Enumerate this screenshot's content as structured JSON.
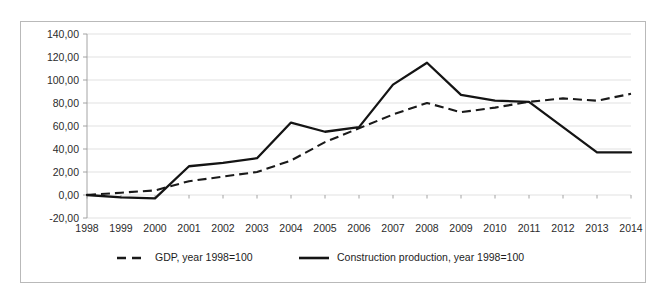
{
  "chart_data": {
    "type": "line",
    "title": "",
    "subtitle": "",
    "xlabel": "",
    "ylabel": "",
    "categories": [
      "1998",
      "1999",
      "2000",
      "2001",
      "2002",
      "2003",
      "2004",
      "2005",
      "2006",
      "2007",
      "2008",
      "2009",
      "2010",
      "2011",
      "2012",
      "2013",
      "2014"
    ],
    "x": [
      1998,
      1999,
      2000,
      2001,
      2002,
      2003,
      2004,
      2005,
      2006,
      2007,
      2008,
      2009,
      2010,
      2011,
      2012,
      2013,
      2014
    ],
    "ylim": [
      -20,
      140
    ],
    "ytick_step": 20,
    "ytick_labels": [
      "140,00",
      "120,00",
      "100,00",
      "80,00",
      "60,00",
      "40,00",
      "20,00",
      "0,00",
      "-20,00"
    ],
    "ytick_values": [
      140,
      120,
      100,
      80,
      60,
      40,
      20,
      0,
      -20
    ],
    "grid": true,
    "legend_position": "bottom",
    "decimal_separator": ",",
    "series": [
      {
        "name": "GDP, year 1998=100",
        "style": "dashed",
        "color": "#1a1a1a",
        "values": [
          0,
          2,
          4,
          12,
          16,
          20,
          30,
          46,
          58,
          70,
          80,
          72,
          76,
          81,
          84,
          82,
          88
        ]
      },
      {
        "name": "Construction production, year 1998=100",
        "style": "solid",
        "color": "#141414",
        "values": [
          0,
          -2,
          -3,
          25,
          28,
          32,
          63,
          55,
          59,
          96,
          115,
          87,
          82,
          81,
          59,
          37,
          37
        ]
      }
    ]
  },
  "legend": {
    "items": [
      {
        "label": "GDP, year 1998=100",
        "style": "dashed"
      },
      {
        "label": "Construction production, year 1998=100",
        "style": "solid"
      }
    ]
  }
}
